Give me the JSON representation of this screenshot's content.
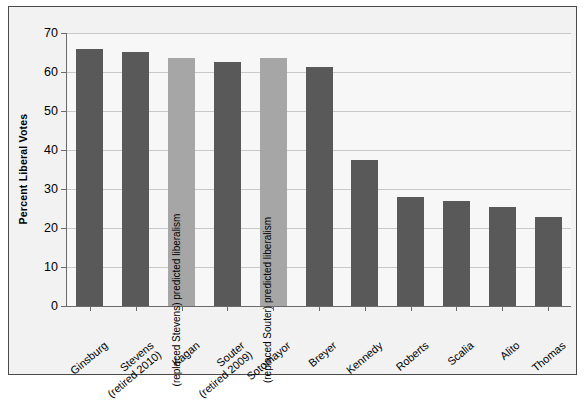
{
  "chart_data": {
    "type": "bar",
    "title": "",
    "xlabel": "",
    "ylabel": "Percent Liberal Votes",
    "ylim": [
      0,
      70
    ],
    "ytick_step": 10,
    "yticks": [
      "0",
      "10",
      "20",
      "30",
      "40",
      "50",
      "60",
      "70"
    ],
    "grid": true,
    "legend": "none",
    "categories": [
      "Ginsburg",
      "Stevens\n(retired 2010)",
      "Kagan",
      "Souter\n(retired 2009)",
      "Sotomayor",
      "Breyer",
      "Kennedy",
      "Roberts",
      "Scalia",
      "Alito",
      "Thomas"
    ],
    "values": [
      66.0,
      65.2,
      63.7,
      62.6,
      63.6,
      61.3,
      37.5,
      28.0,
      27.0,
      25.5,
      22.8
    ],
    "bar_kinds": [
      "actual",
      "actual",
      "predicted",
      "actual",
      "predicted",
      "actual",
      "actual",
      "actual",
      "actual",
      "actual",
      "actual"
    ],
    "bar_annotations": [
      "",
      "",
      "(replaced Stevens) predicted liberalism",
      "",
      "(replaced Souter) predicted liberalism",
      "",
      "",
      "",
      "",
      "",
      ""
    ],
    "colors": {
      "actual": "#595959",
      "predicted": "#a6a6a6",
      "gridline": "#c9c9c9",
      "axis": "#6b6b6b",
      "plot_background": "#f7f7f7",
      "figure_background": "#f2f2f2",
      "frame_border": "#4a4a4a",
      "text": "#000000"
    }
  }
}
